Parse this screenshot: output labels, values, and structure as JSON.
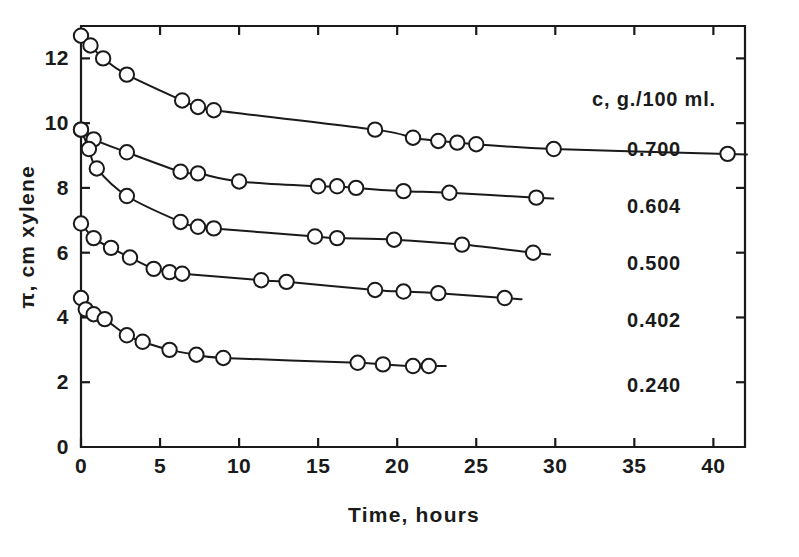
{
  "chart_data": {
    "type": "line",
    "title": "",
    "xlabel": "Time, hours",
    "ylabel": "π, cm xylene",
    "xlim": [
      0,
      42
    ],
    "ylim": [
      0,
      13
    ],
    "xticks": [
      "0",
      "5",
      "10",
      "15",
      "20",
      "25",
      "30",
      "35",
      "40"
    ],
    "xtick_values": [
      0,
      5,
      10,
      15,
      20,
      25,
      30,
      35,
      40
    ],
    "yticks": [
      "0",
      "2",
      "4",
      "6",
      "8",
      "10",
      "12"
    ],
    "ytick_values": [
      0,
      2,
      4,
      6,
      8,
      10,
      12
    ],
    "grid": false,
    "legend_position": "right-inside",
    "legend_title": "c, g./100 ml.",
    "marker": "open-circle",
    "line_color": "#1a1a1a",
    "series": [
      {
        "name": "0.700",
        "label": "0.700",
        "points": [
          [
            0.0,
            12.7
          ],
          [
            0.6,
            12.4
          ],
          [
            1.4,
            12.0
          ],
          [
            2.9,
            11.5
          ],
          [
            6.4,
            10.7
          ],
          [
            7.4,
            10.5
          ],
          [
            8.4,
            10.4
          ],
          [
            18.6,
            9.8
          ],
          [
            21.0,
            9.55
          ],
          [
            22.6,
            9.45
          ],
          [
            23.8,
            9.4
          ],
          [
            25.0,
            9.35
          ],
          [
            29.9,
            9.2
          ],
          [
            40.9,
            9.05
          ]
        ]
      },
      {
        "name": "0.604",
        "label": "0.604",
        "points": [
          [
            0.0,
            9.8
          ],
          [
            0.8,
            9.5
          ],
          [
            2.9,
            9.1
          ],
          [
            6.3,
            8.5
          ],
          [
            7.4,
            8.45
          ],
          [
            10.0,
            8.2
          ],
          [
            15.0,
            8.05
          ],
          [
            16.2,
            8.05
          ],
          [
            17.4,
            8.0
          ],
          [
            20.4,
            7.9
          ],
          [
            23.3,
            7.85
          ],
          [
            28.8,
            7.7
          ]
        ]
      },
      {
        "name": "0.500",
        "label": "0.500",
        "points": [
          [
            0.0,
            9.8
          ],
          [
            0.5,
            9.2
          ],
          [
            1.0,
            8.6
          ],
          [
            2.9,
            7.75
          ],
          [
            6.3,
            6.95
          ],
          [
            7.4,
            6.8
          ],
          [
            8.4,
            6.75
          ],
          [
            14.8,
            6.5
          ],
          [
            16.2,
            6.45
          ],
          [
            19.8,
            6.4
          ],
          [
            24.1,
            6.25
          ],
          [
            28.6,
            6.0
          ]
        ]
      },
      {
        "name": "0.402",
        "label": "0.402",
        "points": [
          [
            0.0,
            6.9
          ],
          [
            0.8,
            6.45
          ],
          [
            1.9,
            6.15
          ],
          [
            3.1,
            5.85
          ],
          [
            4.6,
            5.5
          ],
          [
            5.6,
            5.4
          ],
          [
            6.4,
            5.35
          ],
          [
            11.4,
            5.15
          ],
          [
            13.0,
            5.1
          ],
          [
            18.6,
            4.85
          ],
          [
            20.4,
            4.8
          ],
          [
            22.6,
            4.75
          ],
          [
            26.8,
            4.6
          ]
        ]
      },
      {
        "name": "0.240",
        "label": "0.240",
        "points": [
          [
            0.0,
            4.6
          ],
          [
            0.3,
            4.25
          ],
          [
            0.8,
            4.1
          ],
          [
            1.5,
            3.95
          ],
          [
            2.9,
            3.45
          ],
          [
            3.9,
            3.25
          ],
          [
            5.6,
            3.0
          ],
          [
            7.3,
            2.85
          ],
          [
            9.0,
            2.75
          ],
          [
            17.5,
            2.6
          ],
          [
            19.1,
            2.55
          ],
          [
            21.0,
            2.5
          ],
          [
            22.0,
            2.5
          ]
        ]
      }
    ]
  }
}
